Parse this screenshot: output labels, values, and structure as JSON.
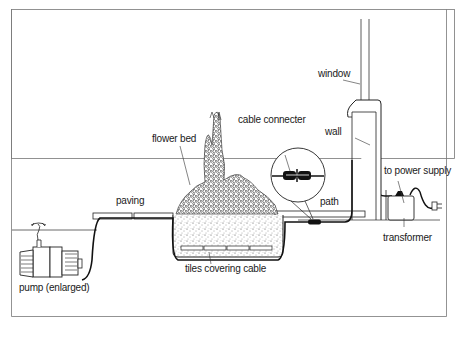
{
  "diagram": {
    "title": "",
    "colors": {
      "line": "#1a1a1a",
      "background": "#ffffff",
      "frame": "#555555"
    },
    "labels": {
      "window": "window",
      "wall": "wall",
      "cable_connecter": "cable connecter",
      "flower_bed": "flower bed",
      "paving": "paving",
      "path": "path",
      "to_power_supply": "to power supply",
      "transformer": "transformer",
      "tiles_covering_cable": "tiles covering cable",
      "pump": "pump (enlarged)"
    },
    "components": [
      {
        "id": "pump",
        "label": "pump (enlarged)"
      },
      {
        "id": "paving",
        "label": "paving"
      },
      {
        "id": "flower-bed",
        "label": "flower bed"
      },
      {
        "id": "tiles",
        "label": "tiles covering cable"
      },
      {
        "id": "cable-connecter",
        "label": "cable connecter"
      },
      {
        "id": "path",
        "label": "path"
      },
      {
        "id": "wall",
        "label": "wall"
      },
      {
        "id": "window",
        "label": "window"
      },
      {
        "id": "transformer",
        "label": "transformer"
      },
      {
        "id": "power-supply",
        "label": "to power supply"
      }
    ]
  }
}
